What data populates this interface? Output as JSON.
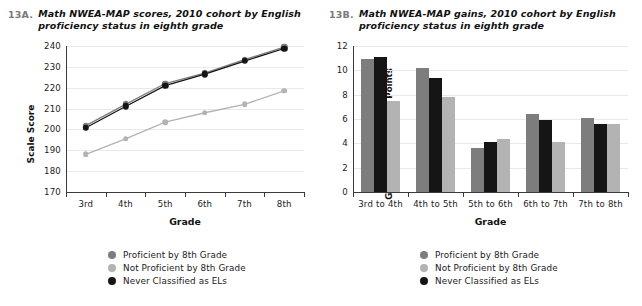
{
  "series_colors": {
    "proficient": "#7d7d7d",
    "not_proficient": "#b3b3b3",
    "never_el": "#151515",
    "gridline": "#e9e9e9",
    "axis": "#3a3a3a"
  },
  "legend": {
    "items": [
      {
        "label": "Proficient by 8th Grade",
        "color": "#7d7d7d",
        "key": "proficient"
      },
      {
        "label": "Not Proficient by 8th Grade",
        "color": "#b3b3b3",
        "key": "not_proficient"
      },
      {
        "label": "Never Classified as ELs",
        "color": "#151515",
        "key": "never_el"
      }
    ]
  },
  "panel_a": {
    "number": "13A.",
    "title": "Math NWEA-MAP scores, 2010 cohort by English proficiency status in eighth grade",
    "chart_data": {
      "type": "line",
      "title": "Math NWEA-MAP scores, 2010 cohort by English proficiency status in eighth grade",
      "xlabel": "Grade",
      "ylabel": "Scale Score",
      "categories": [
        "3rd",
        "4th",
        "5th",
        "6th",
        "7th",
        "8th"
      ],
      "ylim": [
        170,
        240
      ],
      "yticks": [
        170,
        180,
        190,
        200,
        210,
        220,
        230,
        240
      ],
      "grid": true,
      "legend_position": "bottom",
      "series": [
        {
          "name": "Proficient by 8th Grade",
          "color": "#7d7d7d",
          "values": [
            201.8,
            212.0,
            222.0,
            227.0,
            233.5,
            239.5
          ]
        },
        {
          "name": "Not Proficient by 8th Grade",
          "color": "#b3b3b3",
          "values": [
            188.0,
            195.5,
            203.5,
            208.0,
            212.0,
            218.5
          ]
        },
        {
          "name": "Never Classified as ELs",
          "color": "#151515",
          "values": [
            200.8,
            211.0,
            221.0,
            226.5,
            232.8,
            238.8
          ]
        }
      ]
    }
  },
  "panel_b": {
    "number": "13B.",
    "title": "Math NWEA-MAP gains, 2010 cohort by English proficiency status in eighth grade",
    "chart_data": {
      "type": "bar",
      "title": "Math NWEA-MAP gains, 2010 cohort by English proficiency status in eighth grade",
      "xlabel": "Grade",
      "ylabel": "Gains in Scale Score Points",
      "categories": [
        "3rd to 4th",
        "4th to 5th",
        "5th to 6th",
        "6th to 7th",
        "7th to 8th"
      ],
      "ylim": [
        0,
        12
      ],
      "yticks": [
        0,
        2,
        4,
        6,
        8,
        10,
        12
      ],
      "grid": true,
      "legend_position": "bottom",
      "bar_order": [
        "Proficient by 8th Grade",
        "Never Classified as ELs",
        "Not Proficient by 8th Grade"
      ],
      "series": [
        {
          "name": "Proficient by 8th Grade",
          "color": "#7d7d7d",
          "values": [
            10.9,
            10.2,
            3.65,
            6.4,
            6.1
          ]
        },
        {
          "name": "Never Classified as ELs",
          "color": "#151515",
          "values": [
            11.1,
            9.4,
            4.1,
            5.9,
            5.6
          ]
        },
        {
          "name": "Not Proficient by 8th Grade",
          "color": "#b3b3b3",
          "values": [
            7.5,
            7.85,
            4.35,
            4.1,
            5.6
          ]
        }
      ]
    }
  }
}
